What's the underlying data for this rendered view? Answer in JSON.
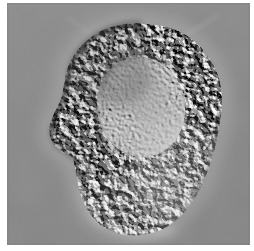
{
  "image": {
    "kind": "micrograph",
    "modality": "differential-interference-contrast",
    "subject": "single adherent cell",
    "colorspace": "grayscale",
    "caption": "",
    "frame": {
      "canvas_width": 254,
      "canvas_height": 251,
      "border_color": "#ffffff",
      "field_left": 7,
      "field_top": 3,
      "field_width": 243,
      "field_height": 242
    },
    "palette": {
      "background_gray": "#878787",
      "background_gray_light": "#8f8f8f",
      "background_gray_dark": "#7e7e7e",
      "cytoplasm_mid": "#9a9a9a",
      "granule_highlight": "#f2f2f2",
      "granule_shadow": "#1f1f1f",
      "nucleus_fill": "#9d9d9d",
      "nucleus_rim_shadow": "#5d5d5d",
      "halo_bright": "#d4d4d4",
      "edge_shadow": "#232323"
    },
    "illumination": {
      "shear_axis_degrees": 315,
      "shadow_direction": "upper-left",
      "highlight_direction": "lower-right"
    },
    "cell": {
      "label": "cell-body",
      "centroid_x": 128,
      "centroid_y": 130,
      "approx_width_px": 165,
      "approx_height_px": 195,
      "outline_points": "148,22 172,28 192,42 206,62 214,86 215,112 210,140 202,168 190,192 174,212 155,226 134,232 112,230 95,220 82,204 74,186 70,168 66,152 52,144 44,132 46,116 54,100 56,84 64,64 80,46 100,32 124,24",
      "notch": {
        "label": "left-concavity",
        "x": 52,
        "y": 140
      }
    },
    "nucleus": {
      "label": "nucleus",
      "center_x": 134,
      "center_y": 104,
      "radius_x": 44,
      "radius_y": 50,
      "rotation_degrees": -8,
      "texture": "smooth-fine-grain",
      "relative_brightness": "slightly-lighter-than-cytoplasm"
    },
    "nucleolus": {
      "label": "nucleolus",
      "center_x": 140,
      "center_y": 96,
      "radius_x": 22,
      "radius_y": 24,
      "visible": true
    },
    "cytoplasm": {
      "label": "granular-cytoplasm",
      "granule_size_px": 4,
      "granule_density": "high",
      "region": "annulus between nucleus and cell margin"
    },
    "halo": {
      "label": "phase-halo",
      "present": true,
      "strongest_edges": [
        "top",
        "bottom-left"
      ]
    },
    "streaks": [
      {
        "label": "filopodial-streak-upper-right",
        "x1": 176,
        "y1": 34,
        "x2": 212,
        "y2": 12
      },
      {
        "label": "filopodial-streak-upper-left",
        "x1": 88,
        "y1": 34,
        "x2": 60,
        "y2": 14
      }
    ]
  }
}
